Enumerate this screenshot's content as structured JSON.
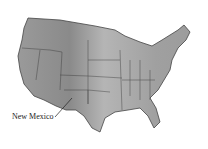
{
  "map": {
    "title": "Contiguous United States relief map",
    "label": {
      "text": "New Mexico",
      "x": 12,
      "y": 112
    },
    "colors": {
      "land": "#a8a8a8",
      "land_dark": "#7a7a7a",
      "border": "#333333",
      "background": "#ffffff"
    }
  }
}
